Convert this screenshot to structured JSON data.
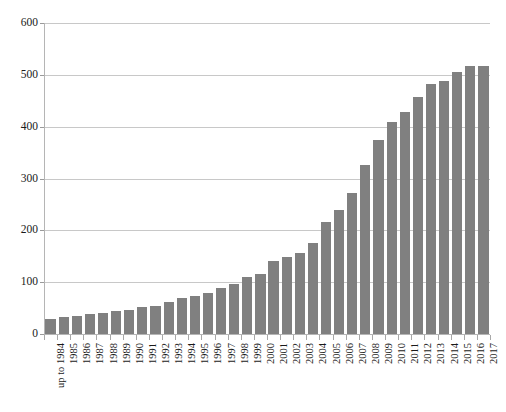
{
  "chart_data": {
    "type": "bar",
    "title": "",
    "subtitle": "",
    "xlabel": "",
    "ylabel": "",
    "ylim": [
      0,
      600
    ],
    "ytick_values": [
      0,
      100,
      200,
      300,
      400,
      500,
      600
    ],
    "ytick_labels": [
      "0",
      "100",
      "200",
      "300",
      "400",
      "500",
      "600"
    ],
    "grid": true,
    "legend": null,
    "legend_position": "none",
    "bar_color": "#808080",
    "gridline_color": "#c8c8c8",
    "axis_color": "#b5b5b5",
    "categories": [
      "up to 1984",
      "1985",
      "1986",
      "1987",
      "1988",
      "1989",
      "1990",
      "1991",
      "1992",
      "1993",
      "1994",
      "1995",
      "1996",
      "1997",
      "1998",
      "1999",
      "2000",
      "2001",
      "2002",
      "2003",
      "2004",
      "2005",
      "2006",
      "2007",
      "2008",
      "2009",
      "2010",
      "2011",
      "2012",
      "2013",
      "2014",
      "2015",
      "2016",
      "2017"
    ],
    "values": [
      29,
      32,
      35,
      38,
      40,
      44,
      47,
      52,
      55,
      62,
      70,
      73,
      80,
      88,
      97,
      110,
      116,
      140,
      148,
      157,
      175,
      216,
      239,
      272,
      326,
      375,
      409,
      428,
      457,
      483,
      489,
      505,
      517,
      517
    ]
  }
}
